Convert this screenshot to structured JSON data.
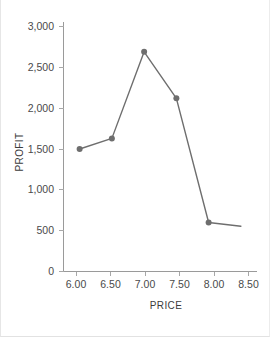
{
  "chart_data": {
    "type": "line",
    "title": "",
    "xlabel": "PRICE",
    "ylabel": "PROFIT",
    "x": [
      6.0,
      6.5,
      7.0,
      7.5,
      8.0,
      8.5
    ],
    "values": [
      1500,
      1630,
      2690,
      2120,
      600,
      555
    ],
    "series": [
      {
        "name": "PROFIT",
        "values": [
          1500,
          1630,
          2690,
          2120,
          600,
          555
        ],
        "marker_points": [
          1500,
          1630,
          2690,
          2120,
          600
        ],
        "color": "#6e6e6e"
      }
    ],
    "xlim": [
      5.75,
      8.75
    ],
    "ylim": [
      0,
      3000
    ],
    "xticks": [
      6.0,
      6.5,
      7.0,
      7.5,
      8.0,
      8.5
    ],
    "xtick_labels": [
      "6.00",
      "6.50",
      "7.00",
      "7.50",
      "8.00",
      "8.50"
    ],
    "yticks": [
      0,
      500,
      1000,
      1500,
      2000,
      2500,
      3000
    ],
    "ytick_labels": [
      "0",
      "500",
      "1,000",
      "1,500",
      "2,000",
      "2,500",
      "3,000"
    ],
    "grid": false,
    "legend": false,
    "legend_position": "none"
  },
  "axes": {
    "x_title": "PRICE",
    "y_title": "PROFIT"
  },
  "ticks": {
    "y0": "0",
    "y1": "500",
    "y2": "1,000",
    "y3": "1,500",
    "y4": "2,000",
    "y5": "2,500",
    "y6": "3,000",
    "x0": "6.00",
    "x1": "6.50",
    "x2": "7.00",
    "x3": "7.50",
    "x4": "8.00",
    "x5": "8.50"
  },
  "colors": {
    "series": "#6e6e6e",
    "axis": "#9a9a9a",
    "text": "#4a4a4a",
    "background": "#ffffff"
  }
}
